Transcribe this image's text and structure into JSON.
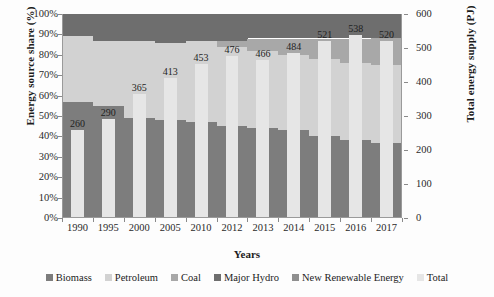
{
  "chart_data": {
    "type": "area",
    "title": "",
    "xlabel": "Years",
    "ylabel": "Energy source share (%)",
    "y2label": "Total energy supply (PJ)",
    "categories": [
      "1990",
      "1995",
      "2000",
      "2005",
      "2010",
      "2012",
      "2013",
      "2014",
      "2015",
      "2016",
      "2017"
    ],
    "ylim": [
      0,
      100
    ],
    "yticks": [
      "0%",
      "10%",
      "20%",
      "30%",
      "40%",
      "50%",
      "60%",
      "70%",
      "80%",
      "90%",
      "100%"
    ],
    "y2lim": [
      0,
      600
    ],
    "y2ticks": [
      "0",
      "100",
      "200",
      "300",
      "400",
      "500",
      "600"
    ],
    "grid": false,
    "legend_position": "bottom",
    "series": [
      {
        "name": "Biomass",
        "color": "#7d7d7d",
        "values": [
          57,
          55,
          49,
          48,
          47,
          45,
          44,
          43,
          40,
          38,
          37
        ]
      },
      {
        "name": "Petroleum",
        "color": "#d2d2d2",
        "values": [
          32,
          32,
          38,
          38,
          40,
          39,
          38,
          37,
          38,
          38,
          38
        ]
      },
      {
        "name": "Coal",
        "color": "#a8a8a8",
        "values": [
          0,
          0,
          0,
          0,
          0,
          3,
          6,
          8,
          10,
          12,
          13
        ]
      },
      {
        "name": "Major Hydro",
        "color": "#6e6e6e",
        "values": [
          11,
          13,
          13,
          14,
          13,
          13,
          12,
          12,
          12,
          12,
          12
        ]
      },
      {
        "name": "New Renewable Energy",
        "color": "#8f8f8f",
        "values": [
          0,
          0,
          0,
          0,
          0,
          0,
          0,
          0,
          0,
          0,
          0
        ]
      }
    ],
    "total": {
      "name": "Total",
      "color": "#e6e6e6",
      "unit": "PJ",
      "values": [
        260,
        290,
        365,
        413,
        453,
        476,
        466,
        484,
        521,
        538,
        520
      ]
    }
  },
  "legend": {
    "items": [
      {
        "label": "Biomass",
        "color": "#7d7d7d"
      },
      {
        "label": "Petroleum",
        "color": "#d2d2d2"
      },
      {
        "label": "Coal",
        "color": "#a8a8a8"
      },
      {
        "label": "Major Hydro",
        "color": "#6e6e6e"
      },
      {
        "label": "New Renewable Energy",
        "color": "#8f8f8f"
      },
      {
        "label": "Total",
        "color": "#e6e6e6"
      }
    ]
  }
}
